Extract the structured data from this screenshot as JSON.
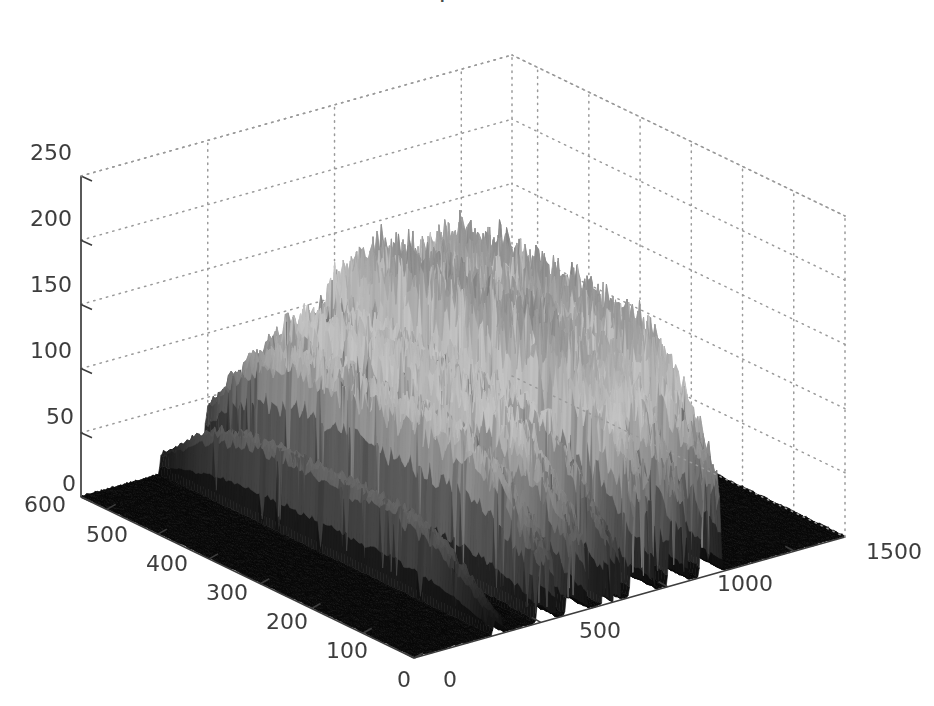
{
  "figure": {
    "background_color": "#ffffff",
    "axis_color": "#3d3d3d",
    "grid_color": "#9a9a9a",
    "grid_style": "dotted",
    "tick_font_size": 22,
    "cropped_title": "sample_data",
    "width": 934,
    "height": 706
  },
  "chart_data": {
    "type": "surface",
    "title": "",
    "subtitle": "",
    "xlabel": "",
    "ylabel": "",
    "zlabel": "",
    "colormap": "gray",
    "shading": "flat-mesh",
    "projection": "3d-axonometric",
    "grid": true,
    "legend": null,
    "xlim": [
      0,
      1700
    ],
    "ylim": [
      0,
      650
    ],
    "zlim": [
      0,
      250
    ],
    "xticks": [
      0,
      500,
      1000,
      1500
    ],
    "yticks": [
      0,
      100,
      200,
      300,
      400,
      500,
      600
    ],
    "zticks": [
      0,
      50,
      100,
      150,
      200,
      250
    ],
    "xticklabels": [
      "0",
      "500",
      "1000",
      "1500"
    ],
    "yticklabels": [
      "0",
      "100",
      "200",
      "300",
      "400",
      "500",
      "600"
    ],
    "zticklabels": [
      "0",
      "50",
      "100",
      "150",
      "200",
      "250"
    ],
    "view_azimuth": -37.5,
    "view_elevation": 30,
    "x_count": 340,
    "y_count": 120,
    "ridges": [
      {
        "x_center": 330,
        "half_width": 20,
        "peak_z": 70,
        "roughness": 0.22,
        "y_center": 330,
        "y_spread": 300
      },
      {
        "x_center": 520,
        "half_width": 34,
        "peak_z": 134,
        "roughness": 0.3,
        "y_center": 320,
        "y_spread": 330
      },
      {
        "x_center": 640,
        "half_width": 38,
        "peak_z": 158,
        "roughness": 0.32,
        "y_center": 320,
        "y_spread": 330
      },
      {
        "x_center": 760,
        "half_width": 16,
        "peak_z": 150,
        "roughness": 0.26,
        "y_center": 320,
        "y_spread": 320
      },
      {
        "x_center": 800,
        "half_width": 12,
        "peak_z": 120,
        "roughness": 0.24,
        "y_center": 320,
        "y_spread": 320
      },
      {
        "x_center": 900,
        "half_width": 44,
        "peak_z": 203,
        "roughness": 0.34,
        "y_center": 320,
        "y_spread": 340
      },
      {
        "x_center": 1040,
        "half_width": 36,
        "peak_z": 188,
        "roughness": 0.33,
        "y_center": 320,
        "y_spread": 335
      },
      {
        "x_center": 1170,
        "half_width": 40,
        "peak_z": 198,
        "roughness": 0.34,
        "y_center": 320,
        "y_spread": 335
      }
    ],
    "baseline_z": 4,
    "floor_color": "#0b0b0b",
    "peak_color_low": "#d9d9d9",
    "peak_color_high": "#111111"
  },
  "axes": {
    "z_ticks": [
      {
        "label": "250",
        "left": 30,
        "top": 142
      },
      {
        "label": "200",
        "left": 30,
        "top": 208
      },
      {
        "label": "150",
        "left": 30,
        "top": 274
      },
      {
        "label": "100",
        "left": 30,
        "top": 340
      },
      {
        "label": "50",
        "left": 46,
        "top": 406
      },
      {
        "label": "0",
        "left": 62,
        "top": 473
      }
    ],
    "y_ticks": [
      {
        "label": "600",
        "left": 24,
        "top": 494
      },
      {
        "label": "500",
        "left": 86,
        "top": 524
      },
      {
        "label": "400",
        "left": 146,
        "top": 553
      },
      {
        "label": "300",
        "left": 206,
        "top": 582
      },
      {
        "label": "200",
        "left": 266,
        "top": 611
      },
      {
        "label": "100",
        "left": 326,
        "top": 640
      },
      {
        "label": "0",
        "left": 397,
        "top": 669
      }
    ],
    "x_ticks": [
      {
        "label": "0",
        "left": 443,
        "top": 669
      },
      {
        "label": "500",
        "left": 579,
        "top": 620
      },
      {
        "label": "1000",
        "left": 717,
        "top": 573
      },
      {
        "label": "1500",
        "left": 866,
        "top": 541
      }
    ]
  }
}
